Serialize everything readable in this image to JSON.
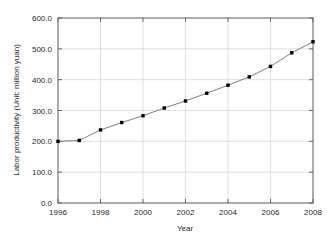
{
  "chart_data": {
    "type": "line",
    "title": "",
    "xlabel": "Year",
    "ylabel": "Labor productivity (Unit: million yuan)",
    "x": [
      1996,
      1997,
      1998,
      1999,
      2000,
      2001,
      2002,
      2003,
      2004,
      2005,
      2006,
      2007,
      2008
    ],
    "values": [
      200,
      203,
      237,
      261,
      283,
      308,
      331,
      356,
      382,
      409,
      443,
      487,
      523
    ],
    "series": [
      {
        "name": "Labor productivity",
        "values": [
          200,
          203,
          237,
          261,
          283,
          308,
          331,
          356,
          382,
          409,
          443,
          487,
          523
        ]
      }
    ],
    "xlim": [
      1996,
      2008
    ],
    "ylim": [
      0.0,
      600.0
    ],
    "xticks": [
      1996,
      1998,
      2000,
      2002,
      2004,
      2006,
      2008
    ],
    "xtick_labels": [
      "1996",
      "1998",
      "2000",
      "2002",
      "2004",
      "2006",
      "2008"
    ],
    "yticks": [
      0.0,
      100.0,
      200.0,
      300.0,
      400.0,
      500.0,
      600.0
    ],
    "ytick_labels": [
      "0.0",
      "100.0",
      "200.0",
      "300.0",
      "400.0",
      "500.0",
      "600.0"
    ],
    "grid": true,
    "legend": "none",
    "marker": "square",
    "marker_color": "#000000",
    "line_color": "#6e6e6e",
    "grid_color": "#d2d2d2",
    "axis_color": "#5a5a5a",
    "background_color": "#ffffff"
  }
}
